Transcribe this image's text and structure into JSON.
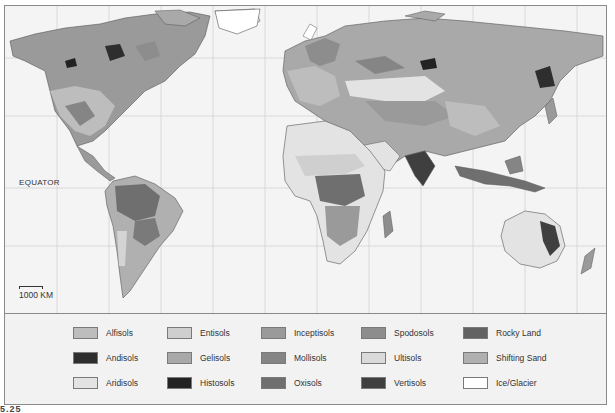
{
  "map": {
    "type": "world soil orders map",
    "equator_label": "Equator",
    "scale_label": "1000 km",
    "figure_label_fragment": "5.25"
  },
  "colors": {
    "ocean": "#f4f4f4",
    "grid": "#d0d0d0",
    "border": "#5a5a5a"
  },
  "legend": {
    "items": [
      {
        "label": "Alfisols",
        "color": "#bdbdbd"
      },
      {
        "label": "Andisols",
        "color": "#2e2e2e"
      },
      {
        "label": "Aridisols",
        "color": "#e3e3e3"
      },
      {
        "label": "Entisols",
        "color": "#cfcfcf"
      },
      {
        "label": "Gelisols",
        "color": "#a9a9a9"
      },
      {
        "label": "Histosols",
        "color": "#232323"
      },
      {
        "label": "Inceptisols",
        "color": "#9a9a9a"
      },
      {
        "label": "Mollisols",
        "color": "#858585"
      },
      {
        "label": "Oxisols",
        "color": "#6f6f6f"
      },
      {
        "label": "Spodosols",
        "color": "#8d8d8d"
      },
      {
        "label": "Ultisols",
        "color": "#dadada"
      },
      {
        "label": "Vertisols",
        "color": "#3f3f3f"
      },
      {
        "label": "Rocky Land",
        "color": "#626262"
      },
      {
        "label": "Shifting Sand",
        "color": "#b0b0b0"
      },
      {
        "label": "Ice/Glacier",
        "color": "#ffffff"
      }
    ]
  }
}
